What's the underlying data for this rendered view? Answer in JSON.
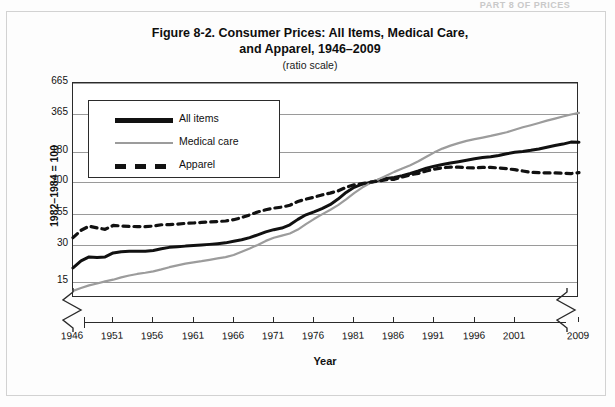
{
  "running_header": "PART 8 OF PRICES",
  "figure": {
    "title_line1": "Figure 8-2. Consumer Prices: All Items, Medical Care,",
    "title_line2": "and Apparel, 1946–2009",
    "subtitle": "(ratio scale)"
  },
  "axes": {
    "y_title": "1982–1984 = 100",
    "x_title": "Year"
  },
  "legend": {
    "items": [
      {
        "label": "All items",
        "style": "solid-black",
        "color": "#111111"
      },
      {
        "label": "Medical care",
        "style": "solid-gray",
        "color": "#9c9c9c"
      },
      {
        "label": "Apparel",
        "style": "dashed-black",
        "color": "#111111"
      }
    ]
  },
  "chart_data": {
    "type": "line",
    "title": "Figure 8-2. Consumer Prices: All Items, Medical Care, and Apparel, 1946–2009",
    "subtitle": "(ratio scale)",
    "xlabel": "Year",
    "ylabel": "1982–1984 = 100",
    "scale": "log",
    "grid": true,
    "legend_position": "upper-left-inside",
    "xlim": [
      1946,
      2009
    ],
    "ylim": [
      11,
      665
    ],
    "ytick_labels": [
      665,
      365,
      180,
      100,
      55,
      30,
      15
    ],
    "xtick_labels": [
      1946,
      1951,
      1956,
      1961,
      1966,
      1971,
      1976,
      1981,
      1986,
      1991,
      1996,
      2001,
      2009
    ],
    "x": [
      1946,
      1947,
      1948,
      1949,
      1950,
      1951,
      1952,
      1953,
      1954,
      1955,
      1956,
      1957,
      1958,
      1959,
      1960,
      1961,
      1962,
      1963,
      1964,
      1965,
      1966,
      1967,
      1968,
      1969,
      1970,
      1971,
      1972,
      1973,
      1974,
      1975,
      1976,
      1977,
      1978,
      1979,
      1980,
      1981,
      1982,
      1983,
      1984,
      1985,
      1986,
      1987,
      1988,
      1989,
      1990,
      1991,
      1992,
      1993,
      1994,
      1995,
      1996,
      1997,
      1998,
      1999,
      2000,
      2001,
      2002,
      2003,
      2004,
      2005,
      2006,
      2007,
      2008,
      2009
    ],
    "series": [
      {
        "name": "All items",
        "color": "#111111",
        "style": "solid",
        "values": [
          19.5,
          22.3,
          24.1,
          23.8,
          24.1,
          26.0,
          26.6,
          26.8,
          26.9,
          26.8,
          27.2,
          28.1,
          28.9,
          29.2,
          29.6,
          29.9,
          30.2,
          30.6,
          31.0,
          31.5,
          32.5,
          33.4,
          34.8,
          36.7,
          38.8,
          40.5,
          41.8,
          44.4,
          49.3,
          53.8,
          56.9,
          60.6,
          65.2,
          72.6,
          82.4,
          90.9,
          96.5,
          99.6,
          103.9,
          107.6,
          109.6,
          113.6,
          118.3,
          124.0,
          130.7,
          136.2,
          140.3,
          144.5,
          148.2,
          152.4,
          156.9,
          160.5,
          163.0,
          166.6,
          172.2,
          177.1,
          179.9,
          184.0,
          188.9,
          195.3,
          201.6,
          207.3,
          215.3,
          214.5
        ]
      },
      {
        "name": "Medical care",
        "color": "#9c9c9c",
        "style": "solid",
        "values": [
          12.6,
          13.3,
          14.0,
          14.5,
          15.1,
          15.6,
          16.3,
          16.9,
          17.4,
          17.8,
          18.3,
          19.0,
          19.8,
          20.5,
          21.2,
          21.7,
          22.2,
          22.8,
          23.4,
          24.0,
          25.0,
          26.6,
          28.3,
          30.3,
          32.7,
          34.7,
          36.2,
          37.7,
          40.6,
          45.0,
          49.6,
          54.2,
          59.0,
          64.7,
          72.3,
          81.4,
          90.5,
          98.5,
          105.5,
          113.5,
          122.0,
          130.0,
          138.6,
          149.3,
          162.9,
          177.1,
          190.2,
          201.4,
          211.1,
          220.6,
          228.2,
          234.8,
          242.2,
          250.8,
          259.9,
          272.4,
          285.6,
          297.3,
          310.2,
          324.1,
          337.0,
          351.3,
          364.5,
          375.6
        ]
      },
      {
        "name": "Apparel",
        "color": "#111111",
        "style": "dashed",
        "values": [
          34.8,
          40.0,
          43.3,
          41.9,
          40.8,
          43.9,
          43.5,
          43.1,
          43.0,
          42.9,
          43.4,
          44.5,
          44.6,
          45.0,
          45.7,
          46.0,
          46.5,
          46.9,
          47.3,
          47.8,
          49.0,
          51.0,
          53.7,
          56.8,
          59.2,
          61.1,
          62.3,
          64.6,
          69.4,
          72.5,
          75.2,
          78.6,
          81.4,
          84.9,
          90.9,
          95.3,
          97.8,
          100.2,
          102.1,
          105.0,
          105.9,
          110.6,
          115.4,
          118.6,
          124.1,
          128.7,
          131.9,
          133.7,
          133.4,
          132.0,
          131.7,
          132.9,
          133.0,
          131.3,
          129.6,
          127.3,
          124.0,
          120.9,
          120.4,
          119.5,
          119.5,
          118.9,
          118.1,
          120.1
        ]
      }
    ]
  }
}
